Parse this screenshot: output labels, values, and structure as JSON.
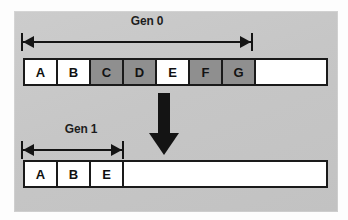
{
  "figure": {
    "background_color": "#c9c9c9",
    "ink_color": "#141414",
    "cell_fill_live": "#ffffff",
    "cell_fill_garbage": "#8f8f8f"
  },
  "gen0": {
    "label": "Gen 0",
    "arrow_name": "gen0-extent-arrow",
    "cells": [
      {
        "label": "A",
        "state": "live"
      },
      {
        "label": "B",
        "state": "live"
      },
      {
        "label": "C",
        "state": "garbage"
      },
      {
        "label": "D",
        "state": "garbage"
      },
      {
        "label": "E",
        "state": "live"
      },
      {
        "label": "F",
        "state": "garbage"
      },
      {
        "label": "G",
        "state": "garbage"
      }
    ],
    "free_label": ""
  },
  "transition": {
    "arrow_name": "collection-down-arrow",
    "direction": "down"
  },
  "gen1": {
    "label": "Gen 1",
    "arrow_name": "gen1-extent-arrow",
    "cells": [
      {
        "label": "A",
        "state": "live"
      },
      {
        "label": "B",
        "state": "live"
      },
      {
        "label": "E",
        "state": "live"
      }
    ],
    "free_label": ""
  }
}
